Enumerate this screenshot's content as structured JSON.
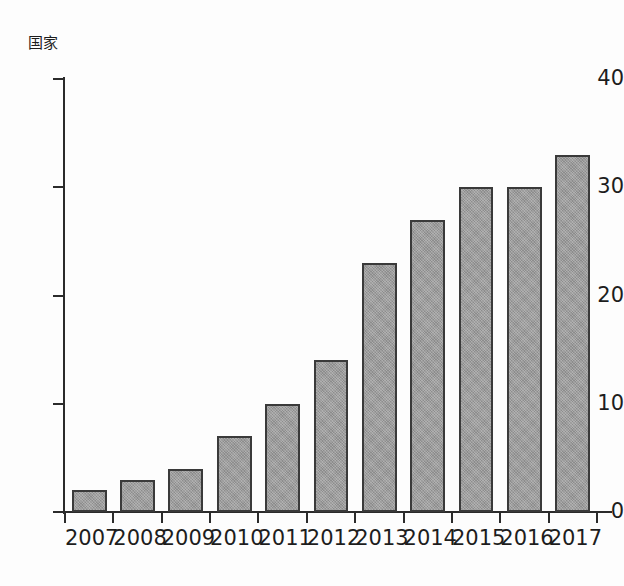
{
  "chart_data": {
    "type": "bar",
    "title": "",
    "subtitle": "",
    "xlabel": "",
    "ylabel": "国家",
    "categories": [
      "2007",
      "2008",
      "2009",
      "2010",
      "2011",
      "2012",
      "2013",
      "2014",
      "2015",
      "2016",
      "2017"
    ],
    "values": [
      2,
      3,
      4,
      7,
      10,
      14,
      23,
      27,
      30,
      30,
      33
    ],
    "ylim": [
      0,
      40
    ],
    "yticks": [
      "0",
      "10",
      "20",
      "30",
      "40"
    ],
    "ytick_values": [
      0,
      10,
      20,
      30,
      40
    ],
    "grid": false,
    "legend": null,
    "bar_color": "#9a9a9a",
    "bar_edge_color": "#3a3a3a",
    "axis_color": "#2b2b2b",
    "background_color": "#fdfdfd"
  }
}
